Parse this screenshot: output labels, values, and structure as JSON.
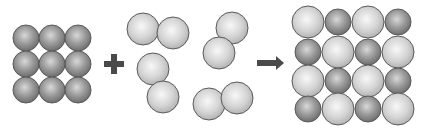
{
  "diagram": {
    "colors": {
      "background": "#ffffff",
      "dark_atom_fill": "#8a8a8a",
      "dark_atom_highlight": "#d6d6d6",
      "light_atom_fill": "#cfcfcf",
      "light_atom_highlight": "#f6f6f6",
      "outline": "#5a5a5a",
      "operator": "#4a4a4a"
    },
    "reactant_lattice": {
      "label": "metal lattice 3x3",
      "radius": 13,
      "atoms": [
        {
          "cx": 26,
          "cy": 38
        },
        {
          "cx": 52,
          "cy": 38
        },
        {
          "cx": 78,
          "cy": 38
        },
        {
          "cx": 26,
          "cy": 64
        },
        {
          "cx": 52,
          "cy": 64
        },
        {
          "cx": 78,
          "cy": 64
        },
        {
          "cx": 26,
          "cy": 90
        },
        {
          "cx": 52,
          "cy": 90
        },
        {
          "cx": 78,
          "cy": 90
        }
      ]
    },
    "plus_sign": {
      "cx": 114,
      "cy": 64,
      "size": 20,
      "thickness": 6
    },
    "molecules": {
      "radius": 16,
      "items": [
        {
          "a": {
            "cx": 143,
            "cy": 29
          },
          "b": {
            "cx": 173,
            "cy": 33
          }
        },
        {
          "a": {
            "cx": 153,
            "cy": 69
          },
          "b": {
            "cx": 163,
            "cy": 97
          }
        },
        {
          "a": {
            "cx": 232,
            "cy": 28
          },
          "b": {
            "cx": 219,
            "cy": 53
          }
        },
        {
          "a": {
            "cx": 209,
            "cy": 104
          },
          "b": {
            "cx": 237,
            "cy": 98
          }
        }
      ]
    },
    "arrow": {
      "x1": 257,
      "x2": 284,
      "y": 63
    },
    "product_lattice": {
      "label": "compound lattice 4x4",
      "large_radius": 16,
      "small_radius": 13,
      "columns": [
        308,
        338,
        368,
        398
      ],
      "rows": [
        22,
        52,
        81,
        109
      ],
      "pattern": [
        [
          "L",
          "S",
          "L",
          "S"
        ],
        [
          "S",
          "L",
          "S",
          "L"
        ],
        [
          "L",
          "S",
          "L",
          "S"
        ],
        [
          "S",
          "L",
          "S",
          "L"
        ]
      ]
    }
  }
}
